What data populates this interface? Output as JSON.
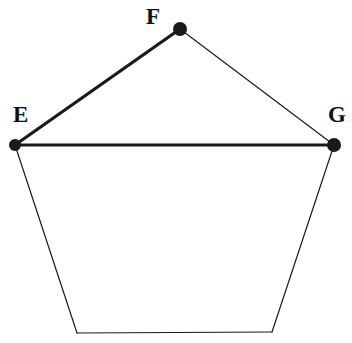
{
  "figure": {
    "background_color": "#ffffff",
    "stroke_color": "#1a1a1a",
    "width": 352,
    "height": 343
  },
  "labels": {
    "e": "E",
    "f": "F",
    "g": "G"
  },
  "chart_data": {
    "type": "diagram",
    "shape": "pentagon",
    "coordinate_system": "pixels, origin top-left",
    "vertices": [
      {
        "name": "E",
        "label": "E",
        "x": 15,
        "y": 145,
        "marked": true,
        "dot_radius": 6
      },
      {
        "name": "F",
        "label": "F",
        "x": 180,
        "y": 29,
        "marked": true,
        "dot_radius": 7
      },
      {
        "name": "G",
        "label": "G",
        "x": 334,
        "y": 145,
        "marked": true,
        "dot_radius": 7
      },
      {
        "name": "BR",
        "label": "",
        "x": 272,
        "y": 332,
        "marked": false,
        "dot_radius": 0
      },
      {
        "name": "BL",
        "label": "",
        "x": 77,
        "y": 333,
        "marked": false,
        "dot_radius": 0
      }
    ],
    "edges": [
      {
        "from": "E",
        "to": "F",
        "weight": "thick",
        "stroke_width": 3.2
      },
      {
        "from": "F",
        "to": "G",
        "weight": "thin",
        "stroke_width": 1.2
      },
      {
        "from": "E",
        "to": "G",
        "weight": "thick",
        "stroke_width": 3.2
      },
      {
        "from": "G",
        "to": "BR",
        "weight": "thin",
        "stroke_width": 1.2
      },
      {
        "from": "BR",
        "to": "BL",
        "weight": "thin",
        "stroke_width": 1.2
      },
      {
        "from": "BL",
        "to": "E",
        "weight": "thin",
        "stroke_width": 1.2
      }
    ],
    "label_positions": [
      {
        "for": "E",
        "x": 13,
        "y": 122,
        "anchor": "start"
      },
      {
        "for": "F",
        "x": 146,
        "y": 24,
        "anchor": "start"
      },
      {
        "for": "G",
        "x": 328,
        "y": 122,
        "anchor": "start"
      }
    ]
  }
}
